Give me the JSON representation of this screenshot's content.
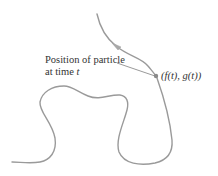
{
  "diagram": {
    "type": "parametric-curve-illustration",
    "colors": {
      "curve": "#9a9a9a",
      "pointer_line": "#9a9a9a",
      "point": "#8a8a8a",
      "text": "#333333",
      "background": "#ffffff"
    },
    "labels": {
      "position_line1": "Position of particle",
      "position_line2_prefix": "at time ",
      "position_line2_var": "t",
      "coordinate": "(f(t), g(t))"
    },
    "point": {
      "x": 156,
      "y": 76
    },
    "arrow": {
      "x": 115,
      "y": 45,
      "direction": "up-left along curve"
    }
  }
}
